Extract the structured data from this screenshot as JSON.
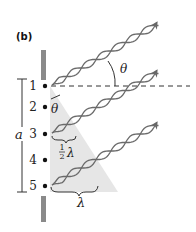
{
  "figure": {
    "panel_label": "(b)",
    "slit_labels": [
      "1",
      "2",
      "3",
      "4",
      "5"
    ],
    "width_label": "a",
    "angle_label_outer": "θ",
    "angle_label_inner": "θ",
    "half_wavelength_num": "1",
    "half_wavelength_den": "2",
    "half_wavelength_symbol": "λ",
    "wavelength_label": "λ",
    "colors": {
      "barrier": "#8a8a8a",
      "wave": "#6a6a6a",
      "shade": "#e6e6e6",
      "ink": "#222222"
    }
  }
}
